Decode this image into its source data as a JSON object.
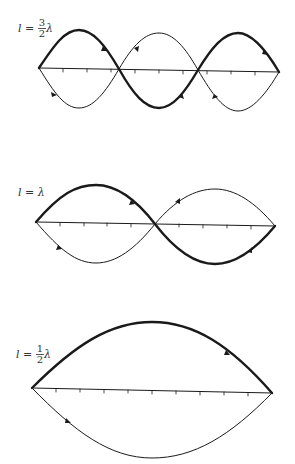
{
  "diagrams": [
    {
      "id": "three-halves",
      "label": {
        "lhs": "l =",
        "num": "3",
        "den": "2",
        "sym": "λ"
      },
      "length_in_wavelengths": 1.5,
      "half_wavelength_segments": 3
    },
    {
      "id": "one",
      "label": {
        "lhs": "l =",
        "sym": "λ"
      },
      "length_in_wavelengths": 1,
      "half_wavelength_segments": 2
    },
    {
      "id": "one-half",
      "label": {
        "lhs": "l =",
        "num": "1",
        "den": "2",
        "sym": "λ"
      },
      "length_in_wavelengths": 0.5,
      "half_wavelength_segments": 1
    }
  ],
  "colors": {
    "line": "#1a1a1a",
    "background": "#ffffff"
  }
}
